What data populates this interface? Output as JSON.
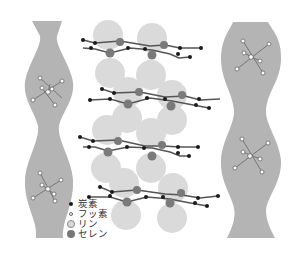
{
  "figure": {
    "colors": {
      "anion_channel": "#b4b4b4",
      "phosphorus_sphere": "#d9d9d9",
      "selenium": "#7a7a7a",
      "carbon": "#1a1a1a",
      "fluorine": "#ffffff",
      "bond": "#555555"
    }
  },
  "legend": {
    "items": [
      {
        "label": "炭素",
        "element": "carbon",
        "marker": "small-black-dot"
      },
      {
        "label": "フッ素",
        "element": "fluorine",
        "marker": "small-white-circle"
      },
      {
        "label": "リン",
        "element": "phosphorus",
        "marker": "light-gray-circle"
      },
      {
        "label": "セレン",
        "element": "selenium",
        "marker": "dark-gray-circle"
      }
    ]
  },
  "structure": {
    "molecule_layers": 4,
    "anion_channels": 2,
    "anions_per_channel": 2
  }
}
